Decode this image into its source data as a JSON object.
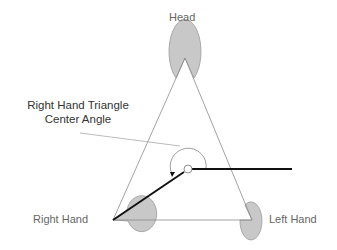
{
  "diagram": {
    "title": "Right Hand Triangle Center Angle",
    "callout": {
      "line1": "Right Hand Triangle",
      "line2": "Center Angle"
    },
    "nodes": [
      {
        "id": "head",
        "label": "Head"
      },
      {
        "id": "right-hand",
        "label": "Right Hand"
      },
      {
        "id": "left-hand",
        "label": "Left Hand"
      }
    ],
    "edges": [
      {
        "from": "head",
        "to": "right-hand",
        "style": "thin"
      },
      {
        "from": "head",
        "to": "left-hand",
        "style": "thin"
      },
      {
        "from": "right-hand",
        "to": "left-hand",
        "style": "thin"
      },
      {
        "from": "right-hand",
        "to": "center",
        "style": "thick"
      },
      {
        "from": "center",
        "to": "reference-horizontal",
        "style": "thick"
      }
    ],
    "colors": {
      "node_fill": "#c8c8c8",
      "node_stroke": "#9a9a9a",
      "thin_line": "#8a8a8a",
      "thick_line": "#111111",
      "label_text": "#666666",
      "callout_text": "#333333"
    }
  }
}
